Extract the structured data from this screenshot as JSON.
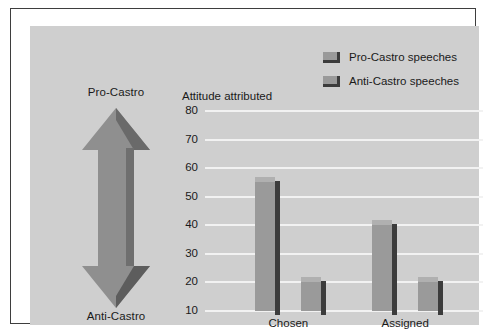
{
  "chart_data": {
    "type": "bar",
    "title": "Attitude attributed",
    "xlabel": "",
    "ylabel": "Attitude attributed",
    "categories": [
      "Chosen",
      "Assigned"
    ],
    "series": [
      {
        "name": "Pro-Castro speeches",
        "values": [
          57,
          42
        ],
        "color": "#9a9a9a"
      },
      {
        "name": "Anti-Castro speeches",
        "values": [
          22,
          22
        ],
        "color": "#9a9a9a"
      }
    ],
    "ylim": [
      10,
      80
    ],
    "yticks": [
      80,
      70,
      60,
      50,
      40,
      30,
      20,
      10
    ],
    "grid": true,
    "legend_position": "top-right",
    "baseline_value": 10,
    "annotations": {
      "scale_top": "Pro-Castro",
      "scale_bottom": "Anti-Castro"
    }
  },
  "legend": {
    "items": [
      {
        "label": "Pro-Castro speeches"
      },
      {
        "label": "Anti-Castro speeches"
      }
    ]
  },
  "scale": {
    "top_label": "Pro-Castro",
    "bottom_label": "Anti-Castro"
  },
  "colors": {
    "plot_background": "#cfcfcf",
    "gridline": "#f2f2f2",
    "bar_light_face": "#9a9a9a",
    "bar_light_cap": "#b0b0b0",
    "bar_dark_side": "#3c3c3c",
    "arrow_fill": "#8f8f8f",
    "arrow_shade": "#5d5d5d",
    "frame_border": "#3e3e3e",
    "text": "#1a1a1a"
  }
}
